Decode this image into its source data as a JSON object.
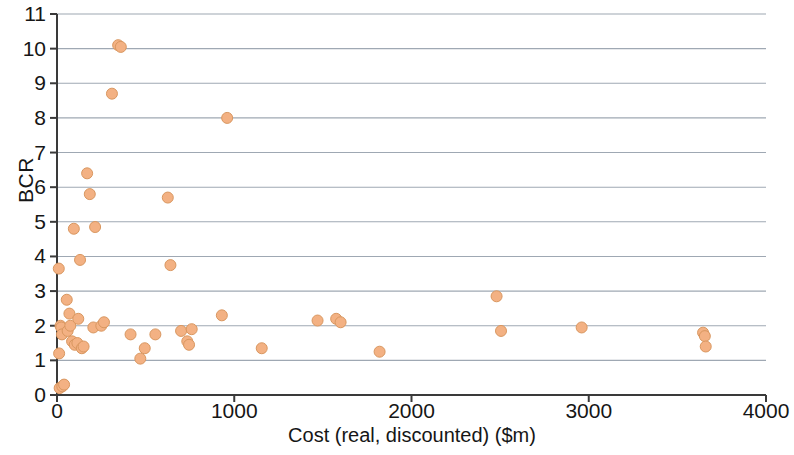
{
  "chart_data": {
    "type": "scatter",
    "title": "",
    "xlabel": "Cost (real, discounted) ($m)",
    "ylabel": "BCR",
    "xlim": [
      0,
      4000
    ],
    "ylim": [
      0,
      11
    ],
    "xticks": [
      0,
      1000,
      2000,
      3000,
      4000
    ],
    "yticks": [
      0,
      1,
      2,
      3,
      4,
      5,
      6,
      7,
      8,
      9,
      10,
      11
    ],
    "xtick_labels": [
      "0",
      "1000",
      "2000",
      "3000",
      "4000"
    ],
    "ytick_labels": [
      "0",
      "1",
      "2",
      "3",
      "4",
      "5",
      "6",
      "7",
      "8",
      "9",
      "10",
      "11"
    ],
    "grid": {
      "horizontal": true,
      "vertical": false,
      "color": "#7f8b99"
    },
    "legend": {
      "visible": false,
      "position": "none"
    },
    "marker": {
      "shape": "circle",
      "fill": "#f3b183",
      "stroke": "#d99760",
      "size": 11
    },
    "series": [
      {
        "name": "Projects",
        "points": [
          [
            10,
            3.65
          ],
          [
            12,
            1.2
          ],
          [
            15,
            0.2
          ],
          [
            20,
            2.0
          ],
          [
            24,
            1.95
          ],
          [
            28,
            1.75
          ],
          [
            30,
            0.25
          ],
          [
            40,
            0.3
          ],
          [
            55,
            2.75
          ],
          [
            60,
            1.85
          ],
          [
            70,
            2.35
          ],
          [
            75,
            2.0
          ],
          [
            85,
            1.55
          ],
          [
            95,
            4.8
          ],
          [
            100,
            1.45
          ],
          [
            115,
            1.5
          ],
          [
            120,
            2.2
          ],
          [
            130,
            3.9
          ],
          [
            140,
            1.35
          ],
          [
            150,
            1.4
          ],
          [
            170,
            6.4
          ],
          [
            185,
            5.8
          ],
          [
            205,
            1.95
          ],
          [
            215,
            4.85
          ],
          [
            250,
            2.0
          ],
          [
            265,
            2.1
          ],
          [
            310,
            8.7
          ],
          [
            345,
            10.1
          ],
          [
            360,
            10.05
          ],
          [
            415,
            1.75
          ],
          [
            470,
            1.05
          ],
          [
            495,
            1.35
          ],
          [
            555,
            1.75
          ],
          [
            625,
            5.7
          ],
          [
            640,
            3.75
          ],
          [
            700,
            1.85
          ],
          [
            735,
            1.55
          ],
          [
            745,
            1.45
          ],
          [
            760,
            1.9
          ],
          [
            930,
            2.3
          ],
          [
            960,
            8.0
          ],
          [
            1155,
            1.35
          ],
          [
            1470,
            2.15
          ],
          [
            1575,
            2.2
          ],
          [
            1600,
            2.1
          ],
          [
            1820,
            1.25
          ],
          [
            2480,
            2.85
          ],
          [
            2505,
            1.85
          ],
          [
            2960,
            1.95
          ],
          [
            3645,
            1.8
          ],
          [
            3655,
            1.7
          ],
          [
            3660,
            1.4
          ]
        ]
      }
    ]
  }
}
